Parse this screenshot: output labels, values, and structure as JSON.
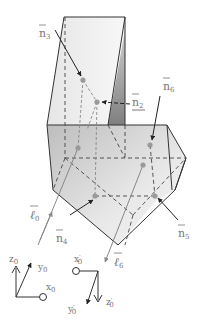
{
  "figure": {
    "type": "3d-polyhedron-ray-diagram",
    "colors": {
      "edge": "#333333",
      "hidden_edge": "#444444",
      "face_light": "#f2f2f2",
      "face_mid": "#d9d9d9",
      "face_dark": "#9a9a9a",
      "ray": "#888888",
      "point": "#999999",
      "label": "#777777"
    },
    "normals": [
      {
        "id": "n3",
        "base": "n",
        "sub": "3"
      },
      {
        "id": "n2",
        "base": "n",
        "sub": "2"
      },
      {
        "id": "n6",
        "base": "n",
        "sub": "6"
      },
      {
        "id": "n4",
        "base": "n",
        "sub": "4"
      },
      {
        "id": "n5",
        "base": "n",
        "sub": "5"
      }
    ],
    "rays": [
      {
        "id": "l0",
        "base": "ℓ",
        "sub": "0"
      },
      {
        "id": "l6",
        "base": "ℓ",
        "sub": "6"
      }
    ],
    "frames": {
      "input": {
        "z": "z",
        "z_sub": "0",
        "y": "y",
        "y_sub": "0",
        "x": "x",
        "x_sub": "0"
      },
      "output": {
        "x": "x",
        "x_sub": "0",
        "x_prime": "′",
        "y": "y",
        "y_sub": "0",
        "y_prime": "′",
        "z": "z",
        "z_sub": "0",
        "z_prime": "′"
      }
    }
  }
}
